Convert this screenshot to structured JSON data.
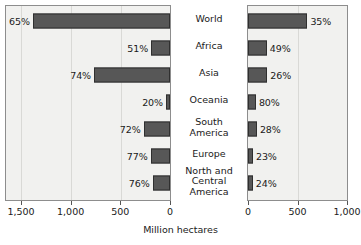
{
  "chart_data": {
    "type": "bar",
    "title": "",
    "subtitle": "",
    "xlabel": "Million hectares",
    "ylabel": "",
    "orientation": "horizontal",
    "layout": "bidirectional-pyramid",
    "grid": true,
    "legend_position": "none",
    "categories": [
      "World",
      "Africa",
      "Asia",
      "Oceania",
      "South America",
      "Europe",
      "North and Central America"
    ],
    "category_display": [
      "World",
      "Africa",
      "Asia",
      "Oceania",
      "South\nAmerica",
      "Europe",
      "North and\nCentral\nAmerica"
    ],
    "panels": [
      {
        "name": "left",
        "direction": "left",
        "xlim": [
          0,
          1500
        ],
        "axis_reversed": true,
        "ticks": [
          1500,
          1000,
          500,
          0
        ],
        "tick_labels": [
          "1,500",
          "1,000",
          "500",
          "0"
        ],
        "values": [
          1380,
          190,
          765,
          35,
          265,
          195,
          175
        ],
        "data_labels": [
          "65%",
          "51%",
          "74%",
          "20%",
          "72%",
          "77%",
          "76%"
        ]
      },
      {
        "name": "right",
        "direction": "right",
        "xlim": [
          0,
          1000
        ],
        "axis_reversed": false,
        "ticks": [
          0,
          500,
          1000
        ],
        "tick_labels": [
          "0",
          "500",
          "1,000"
        ],
        "values": [
          600,
          190,
          195,
          80,
          90,
          50,
          48
        ],
        "data_labels": [
          "35%",
          "49%",
          "26%",
          "80%",
          "28%",
          "23%",
          "24%"
        ]
      }
    ],
    "colors": {
      "bar_fill": "#575757",
      "bar_stroke": "#2f2f2f",
      "plot_background": "#f1f1ef",
      "gridline": "#d9d9d6",
      "panel_border": "#8d8d8d",
      "text": "#1a1a1a",
      "page_background": "#ffffff"
    }
  }
}
